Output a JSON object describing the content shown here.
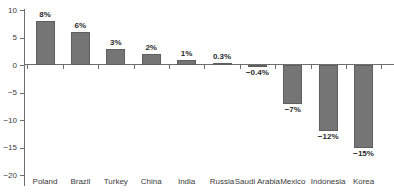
{
  "chart_data": {
    "type": "bar",
    "title": "",
    "subtitle": "",
    "xlabel": "",
    "ylabel": "",
    "ylim": [
      -20,
      10
    ],
    "grid": false,
    "legend": "none",
    "orientation": "vertical",
    "bar_color": "#757575",
    "bar_edge_color": "#5f5f5f",
    "axis_color": "#6e6e6e",
    "text_color": "#3a3a3a",
    "y_ticks": [
      10,
      5,
      0,
      -5,
      -10,
      -15,
      -20
    ],
    "y_tick_labels": [
      "10",
      "5",
      "0",
      "−5",
      "−10",
      "−15",
      "−20"
    ],
    "categories": [
      "Poland",
      "Brazil",
      "Turkey",
      "China",
      "India",
      "Russia",
      "Saudi Arabia",
      "Mexico",
      "Indonesia",
      "Korea"
    ],
    "values": [
      8,
      6,
      3,
      2,
      1,
      0.3,
      -0.4,
      -7,
      -12,
      -15
    ],
    "data_labels": [
      "8%",
      "6%",
      "3%",
      "2%",
      "1%",
      "0.3%",
      "−0.4%",
      "−7%",
      "−12%",
      "−15%"
    ]
  }
}
